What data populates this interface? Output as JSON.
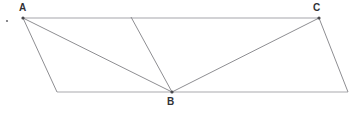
{
  "figure": {
    "background_color": "#ffffff",
    "line_color": "#8e8e92",
    "label_color": "#313135",
    "canvas": {
      "width": 356,
      "height": 114
    },
    "vertices": [
      {
        "id": "A",
        "label": "A",
        "x": 23,
        "y": 18,
        "label_x": 19,
        "label_y": 3,
        "marked": true
      },
      {
        "id": "C",
        "label": "C",
        "x": 319,
        "y": 18,
        "label_x": 313,
        "label_y": 3,
        "marked": true
      },
      {
        "id": "B",
        "label": "B",
        "x": 172,
        "y": 92,
        "label_x": 167,
        "label_y": 97,
        "marked": true
      },
      {
        "id": "D",
        "label": "",
        "x": 57,
        "y": 92,
        "label_x": 0,
        "label_y": 0,
        "marked": false
      },
      {
        "id": "E",
        "label": "",
        "x": 348,
        "y": 92,
        "label_x": 0,
        "label_y": 0,
        "marked": false
      },
      {
        "id": "F",
        "label": "",
        "x": 131,
        "y": 17,
        "label_x": 0,
        "label_y": 0,
        "marked": false
      }
    ],
    "edges": [
      {
        "name": "top-edge-A-to-C",
        "from": "A",
        "to": "C",
        "style": "fig-line-top"
      },
      {
        "name": "bottom-edge-D-to-E",
        "from": "D",
        "to": "E",
        "style": "fig-line-bottom"
      },
      {
        "name": "left-side-A-to-D",
        "from": "A",
        "to": "D",
        "style": "fig-line"
      },
      {
        "name": "right-side-C-to-E",
        "from": "C",
        "to": "E",
        "style": "fig-line"
      },
      {
        "name": "diagonal-A-to-B",
        "from": "A",
        "to": "B",
        "style": "fig-line"
      },
      {
        "name": "diagonal-B-to-C",
        "from": "B",
        "to": "C",
        "style": "fig-line"
      },
      {
        "name": "cevian-F-to-B",
        "from": "F",
        "to": "B",
        "style": "fig-line"
      }
    ],
    "stray_mark": {
      "name": "stray-dot",
      "x": 7,
      "y": 21,
      "r": 1.1
    }
  }
}
